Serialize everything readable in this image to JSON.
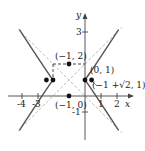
{
  "figure": {
    "equation_described": "(x+1)^2 - (y-1)^2 = 1",
    "axes": {
      "x_label": "x",
      "y_label": "y",
      "x_ticks": [
        "-4",
        "-3",
        "1",
        "2"
      ],
      "y_ticks": [
        "3",
        "-1"
      ]
    },
    "points": [
      {
        "name": "center",
        "label": "(-1, 1)",
        "x": -1,
        "y": 1
      },
      {
        "name": "box-top",
        "label": "(−1, 2)",
        "x": -1,
        "y": 2
      },
      {
        "name": "box-bottom",
        "label": "(−1, 0)",
        "x": -1,
        "y": 0
      },
      {
        "name": "vertex-right",
        "label": "(0, 1)",
        "x": 0,
        "y": 1
      },
      {
        "name": "vertex-left",
        "label": "",
        "x": -2,
        "y": 1
      },
      {
        "name": "focus-right",
        "label": "(−1 +√2, 1)",
        "x": 0.414,
        "y": 1
      },
      {
        "name": "focus-left",
        "label": "",
        "x": -2.414,
        "y": 1
      }
    ],
    "labels": {
      "box_top": "(−1, 2)",
      "box_bottom": "(−1, 0)",
      "vertex_right": "(0, 1)",
      "focus_right": "(−1 +√2, 1)"
    },
    "colors": {
      "curve": "#555555",
      "asymptote": "#aaaaaa",
      "axis": "#444444",
      "point": "#111111"
    }
  }
}
